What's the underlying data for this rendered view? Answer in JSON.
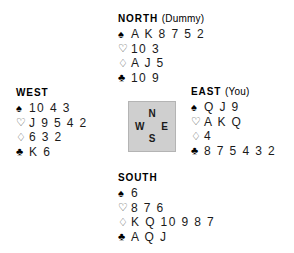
{
  "board": {
    "background_color": "#ffffff",
    "text_color": "#1a1a1a"
  },
  "compass": {
    "box_color": "#cfcfcf",
    "border_color": "#b4b4b4",
    "north": "N",
    "west": "W",
    "east": "E",
    "south": "S"
  },
  "suits": {
    "spade": "♠",
    "heart": "♡",
    "diamond": "♢",
    "club": "♣"
  },
  "hands": {
    "north": {
      "seat": "NORTH",
      "role": "(Dummy)",
      "spades": "A K 8 7 5 2",
      "hearts": "10 3",
      "diamonds": "A J 5",
      "clubs": "10 9"
    },
    "west": {
      "seat": "WEST",
      "role": "",
      "spades": "10 4 3",
      "hearts": "J 9 5 4 2",
      "diamonds": "6 3 2",
      "clubs": "K 6"
    },
    "east": {
      "seat": "EAST",
      "role": "(You)",
      "spades": "Q J 9",
      "hearts": "A K Q",
      "diamonds": "4",
      "clubs": "8 7 5 4 3 2"
    },
    "south": {
      "seat": "SOUTH",
      "role": "",
      "spades": "6",
      "hearts": "8 7 6",
      "diamonds": "K Q 10 9 8 7",
      "clubs": "A Q J"
    }
  }
}
